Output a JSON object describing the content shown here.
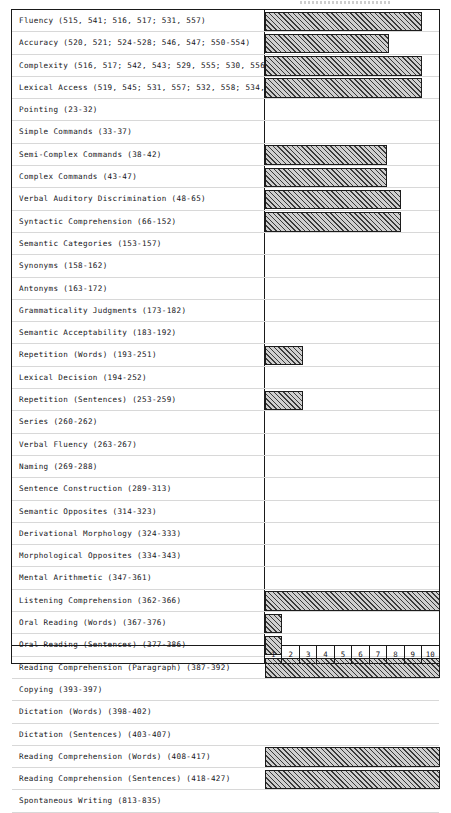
{
  "chart_data": {
    "type": "bar",
    "orientation": "horizontal",
    "title": "",
    "xlabel": "",
    "ylabel": "",
    "xlim": [
      0,
      10
    ],
    "grid": false,
    "legend": null,
    "axis_ticks": [
      "1",
      "2",
      "3",
      "4",
      "5",
      "6",
      "7",
      "8",
      "9",
      "10"
    ],
    "categories": [
      "Fluency (515, 541; 516, 517; 531, 557)",
      "Accuracy (520, 521; 524-528; 546, 547; 550-554)",
      "Complexity (516, 517; 542, 543; 529, 555; 530, 556)",
      "Lexical Access (519, 545; 531, 557; 532, 558; 534, 560)",
      "Pointing (23-32)",
      "Simple Commands (33-37)",
      "Semi-Complex Commands (38-42)",
      "Complex Commands (43-47)",
      "Verbal Auditory Discrimination  (48-65)",
      "Syntactic Comprehension (66-152)",
      "Semantic Categories (153-157)",
      "Synonyms (158-162)",
      "Antonyms (163-172)",
      "Grammaticality Judgments (173-182)",
      "Semantic Acceptability (183-192)",
      "Repetition (Words) (193-251)",
      "Lexical Decision (194-252)",
      "Repetition (Sentences) (253-259)",
      "Series (260-262)",
      "Verbal Fluency (263-267)",
      "Naming (269-288)",
      "Sentence Construction (289-313)",
      "Semantic Opposites (314-323)",
      "Derivational Morphology (324-333)",
      "Morphological Opposites (334-343)",
      "Mental Arithmetic (347-361)",
      "Listening Comprehension (362-366)",
      "Oral Reading (Words) (367-376)",
      "Oral Reading (Sentences) (377-386)",
      "Reading Comprehension (Paragraph) (387-392)",
      "Copying (393-397)",
      "Dictation (Words) (398-402)",
      "Dictation (Sentences) (403-407)",
      "Reading Comprehension (Words) (408-417)",
      "Reading Comprehension (Sentences) (418-427)",
      "Spontaneous Writing (813-835)"
    ],
    "values": [
      9.0,
      7.1,
      9.0,
      9.0,
      0,
      0,
      7.0,
      7.0,
      7.8,
      7.8,
      0,
      0,
      0,
      0,
      0,
      2.2,
      0,
      2.2,
      0,
      0,
      0,
      0,
      0,
      0,
      0,
      0,
      10.0,
      1.0,
      1.0,
      10.0,
      0,
      0,
      0,
      10.0,
      10.0,
      0
    ]
  },
  "axis": {
    "ticks": [
      "1",
      "2",
      "3",
      "4",
      "5",
      "6",
      "7",
      "8",
      "9",
      "10"
    ]
  }
}
